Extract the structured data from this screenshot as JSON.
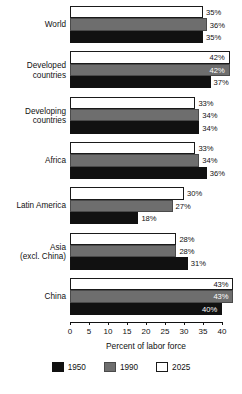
{
  "chart_data": {
    "type": "bar",
    "orientation": "horizontal",
    "title": "",
    "xlabel": "Percent of labor force",
    "ylabel": "",
    "xlim": [
      0,
      40
    ],
    "xticks": [
      0,
      5,
      10,
      15,
      20,
      25,
      30,
      35,
      40
    ],
    "xtick_labels": [
      "0",
      "5",
      "10",
      "15",
      "20",
      "25",
      "30",
      "35",
      "40"
    ],
    "grid": false,
    "legend_position": "bottom",
    "categories": [
      "World",
      "Developed countries",
      "Developing countries",
      "Africa",
      "Latin America",
      "Asia (excl. China)",
      "China"
    ],
    "series": [
      {
        "name": "1950",
        "color": "#111111",
        "values": [
          35,
          37,
          34,
          36,
          18,
          31,
          40
        ]
      },
      {
        "name": "1990",
        "color": "#6e6e6e",
        "values": [
          36,
          42,
          34,
          34,
          27,
          28,
          43
        ]
      },
      {
        "name": "2025",
        "color": "#ffffff",
        "values": [
          35,
          42,
          33,
          33,
          30,
          28,
          43
        ]
      }
    ],
    "value_label_suffix": "%"
  },
  "groups": [
    {
      "label_line1": "World",
      "label_line2": "",
      "rows": [
        {
          "series": "2025",
          "value": 35,
          "label": "35%",
          "placement": "outside"
        },
        {
          "series": "1990",
          "value": 36,
          "label": "36%",
          "placement": "outside"
        },
        {
          "series": "1950",
          "value": 35,
          "label": "35%",
          "placement": "outside"
        }
      ]
    },
    {
      "label_line1": "Developed",
      "label_line2": "countries",
      "rows": [
        {
          "series": "2025",
          "value": 42,
          "label": "42%",
          "placement": "inside-light"
        },
        {
          "series": "1990",
          "value": 42,
          "label": "42%",
          "placement": "inside-dark"
        },
        {
          "series": "1950",
          "value": 37,
          "label": "37%",
          "placement": "outside"
        }
      ]
    },
    {
      "label_line1": "Developing",
      "label_line2": "countries",
      "rows": [
        {
          "series": "2025",
          "value": 33,
          "label": "33%",
          "placement": "outside"
        },
        {
          "series": "1990",
          "value": 34,
          "label": "34%",
          "placement": "outside"
        },
        {
          "series": "1950",
          "value": 34,
          "label": "34%",
          "placement": "outside"
        }
      ]
    },
    {
      "label_line1": "Africa",
      "label_line2": "",
      "rows": [
        {
          "series": "2025",
          "value": 33,
          "label": "33%",
          "placement": "outside"
        },
        {
          "series": "1990",
          "value": 34,
          "label": "34%",
          "placement": "outside"
        },
        {
          "series": "1950",
          "value": 36,
          "label": "36%",
          "placement": "outside"
        }
      ]
    },
    {
      "label_line1": "Latin America",
      "label_line2": "",
      "rows": [
        {
          "series": "2025",
          "value": 30,
          "label": "30%",
          "placement": "outside"
        },
        {
          "series": "1990",
          "value": 27,
          "label": "27%",
          "placement": "outside"
        },
        {
          "series": "1950",
          "value": 18,
          "label": "18%",
          "placement": "outside"
        }
      ]
    },
    {
      "label_line1": "Asia",
      "label_line2": "(excl. China)",
      "rows": [
        {
          "series": "2025",
          "value": 28,
          "label": "28%",
          "placement": "outside"
        },
        {
          "series": "1990",
          "value": 28,
          "label": "28%",
          "placement": "outside"
        },
        {
          "series": "1950",
          "value": 31,
          "label": "31%",
          "placement": "outside"
        }
      ]
    },
    {
      "label_line1": "China",
      "label_line2": "",
      "rows": [
        {
          "series": "2025",
          "value": 43,
          "label": "43%",
          "placement": "inside-light"
        },
        {
          "series": "1990",
          "value": 43,
          "label": "43%",
          "placement": "inside-dark"
        },
        {
          "series": "1950",
          "value": 40,
          "label": "40%",
          "placement": "inside-dark"
        }
      ]
    }
  ],
  "axis": {
    "title": "Percent of labor force",
    "ticks": [
      "0",
      "5",
      "10",
      "15",
      "20",
      "25",
      "30",
      "35",
      "40"
    ]
  },
  "legend": {
    "items": [
      {
        "label": "1950",
        "swatch": "s1950"
      },
      {
        "label": "1990",
        "swatch": "s1990"
      },
      {
        "label": "2025",
        "swatch": "s2025"
      }
    ]
  }
}
